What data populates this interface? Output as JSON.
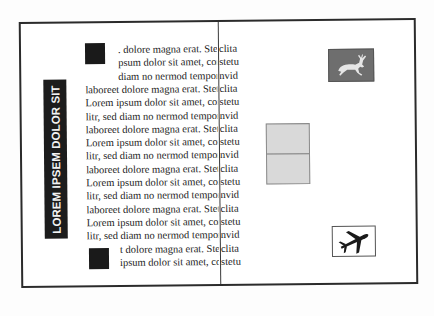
{
  "side_label": {
    "text": "LOREM IPSEM DOLOR SIT"
  },
  "text_column": {
    "lines": [
      {
        "text": ". dolore magna erat. Stet clita",
        "indent": true
      },
      {
        "text": "psum dolor sit amet, consetetu",
        "indent": true
      },
      {
        "text": "diam no nermod tempor invid",
        "indent": true
      },
      {
        "text": "laboreet dolore magna erat. Stet clita",
        "indent": false
      },
      {
        "text": "Lorem ipsum dolor sit amet, consetetu",
        "indent": false
      },
      {
        "text": "litr, sed diam no nermod tempor invid",
        "indent": false
      },
      {
        "text": "laboreet dolore magna erat. Stet clita",
        "indent": false
      },
      {
        "text": "Lorem ipsum dolor sit amet, consetetu",
        "indent": false
      },
      {
        "text": "litr, sed diam no nermod tempor invid",
        "indent": false
      },
      {
        "text": "laboreet dolore magna erat. Stet clita",
        "indent": false
      },
      {
        "text": "Lorem ipsum dolor sit amet, consetetu",
        "indent": false
      },
      {
        "text": "litr, sed diam no nermod tempor invid",
        "indent": false
      },
      {
        "text": "laboreet dolore magna erat. Stet clita",
        "indent": false
      },
      {
        "text": "Lorem ipsum dolor sit amet, consetetu",
        "indent": false
      },
      {
        "text": "litr, sed diam no nermod tempor invid",
        "indent": false
      },
      {
        "text": "t dolore magna erat. Stet clita",
        "indent": true
      },
      {
        "text": "ipsum dolor sit amet, consetetu",
        "indent": true
      }
    ],
    "overflow_fragments": [
      "clita",
      "stetu",
      "nvid",
      "clita",
      "stetu",
      "nvid",
      "clita",
      "stetu",
      "nvid",
      "clita",
      "stetu",
      "nvid",
      "clita",
      "stetu",
      "nvid",
      "clita",
      "stetu"
    ]
  },
  "icons": {
    "top_marker": "square-marker-icon",
    "bottom_marker": "square-marker-icon",
    "deer": "reindeer-icon",
    "panel": "grey-panel-placeholder",
    "plane": "airplane-icon"
  },
  "colors": {
    "frame": "#2b2b2b",
    "label_bg": "#1c1c1c",
    "label_text": "#f2f2f2",
    "deer_bg": "#6e6e6e",
    "panel_bg": "#d9d9d9"
  }
}
